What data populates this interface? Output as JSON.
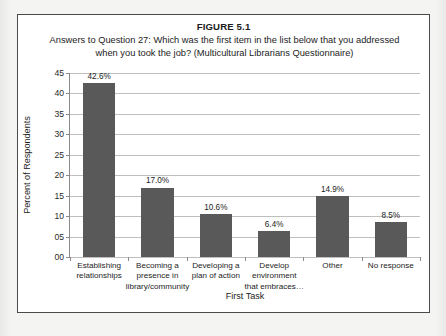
{
  "figure": {
    "label": "FIGURE 5.1",
    "caption": "Answers to Question 27: Which was the first item in the list below that you addressed when you took the job? (Multicultural Librarians Questionnaire)",
    "caption_line1": "Answers to Question 27: Which was the first item in the list below that you addressed",
    "caption_line2": "when you took the job? (Multicultural Librarians Questionnaire)"
  },
  "colors": {
    "bar_fill": "#595959",
    "gridline": "#bfbfbf",
    "axis": "#8a8a8a",
    "frame_border": "#4a4a4a",
    "page_background": "#f2f2f1",
    "figure_background": "#ffffff",
    "text": "#1c1c1c"
  },
  "chart_data": {
    "type": "bar",
    "title": "Answers to Question 27: Which was the first item in the list below that you addressed when you took the job? (Multicultural Librarians Questionnaire)",
    "xlabel": "First Task",
    "ylabel": "Percent of Respondents",
    "categories": [
      "Establishing relationships",
      "Becoming a presence in library/community",
      "Developing a plan of action",
      "Develop environment that embraces…",
      "Other",
      "No response"
    ],
    "category_lines": [
      [
        "Establishing",
        "relationships"
      ],
      [
        "Becoming a",
        "presence in",
        "library/community"
      ],
      [
        "Developing a",
        "plan of action"
      ],
      [
        "Develop",
        "environment",
        "that embraces…"
      ],
      [
        "Other"
      ],
      [
        "No response"
      ]
    ],
    "values": [
      42.6,
      17.0,
      10.6,
      6.4,
      14.9,
      8.5
    ],
    "value_labels": [
      "42.6%",
      "17.0%",
      "10.6%",
      "6.4%",
      "14.9%",
      "8.5%"
    ],
    "ylim": [
      0,
      45
    ],
    "ytick_values": [
      0,
      5,
      10,
      15,
      20,
      25,
      30,
      35,
      40,
      45
    ],
    "ytick_labels": [
      "00",
      "05",
      "10",
      "15",
      "20",
      "25",
      "30",
      "35",
      "40",
      "45"
    ],
    "grid": true,
    "grid_axis": "y",
    "legend": false,
    "legend_position": "none",
    "series": [
      {
        "name": "Percent of Respondents",
        "values": [
          42.6,
          17.0,
          10.6,
          6.4,
          14.9,
          8.5
        ]
      }
    ]
  }
}
